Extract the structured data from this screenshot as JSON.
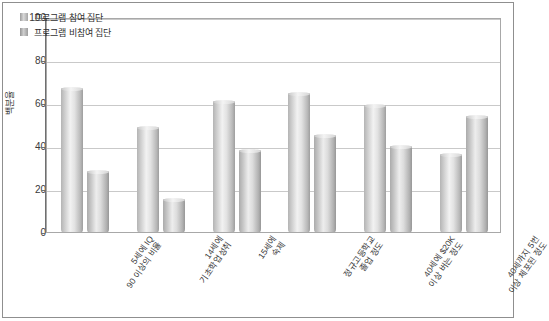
{
  "chart_data": {
    "type": "bar",
    "title": "",
    "subtitle": "",
    "xlabel": "",
    "ylabel": "백분율",
    "ylim": [
      0,
      100
    ],
    "yticks": [
      0,
      20,
      40,
      60,
      80,
      100
    ],
    "grid": true,
    "legend_position": "top-left",
    "categories": [
      "5세에 IQ 90 이상의 비율",
      "14세에 기초학업성취",
      "15세에 숙제",
      "정규고등학교 졸업 정도",
      "40세에 $20K 이상 버는 정도",
      "40세까지 5번 이상 체포된 정도"
    ],
    "series": [
      {
        "name": "프로그램 참여 집단",
        "values": [
          67,
          49,
          61,
          65,
          59,
          36
        ],
        "color": "#d8d8d8"
      },
      {
        "name": "프로그램 비참여 집단",
        "values": [
          28,
          15,
          38,
          45,
          40,
          54
        ],
        "color": "#cfcfcf"
      }
    ]
  },
  "axis": {
    "y_tick_labels": [
      "100",
      "80",
      "60",
      "40",
      "20",
      "0"
    ]
  }
}
